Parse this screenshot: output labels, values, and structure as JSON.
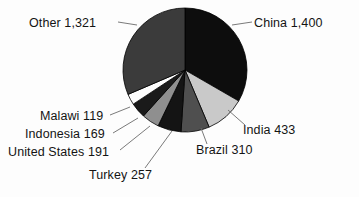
{
  "chart_data": {
    "type": "pie",
    "title": "",
    "total": 4200,
    "unit": "",
    "legend_position": "none",
    "labels_outside": true,
    "categories": [
      "China",
      "India",
      "Brazil",
      "Turkey",
      "United States",
      "Indonesia",
      "Malawi",
      "Other"
    ],
    "values": [
      1400,
      433,
      310,
      257,
      191,
      169,
      119,
      1321
    ],
    "value_labels": [
      "1,400",
      "433",
      "310",
      "257",
      "191",
      "169",
      "119",
      "1,321"
    ],
    "slices": [
      {
        "name": "China",
        "value": 1400,
        "value_label": "1,400",
        "label": "China 1,400",
        "color": "#0d0d0d",
        "start_angle": 0.0,
        "end_angle": 120.0
      },
      {
        "name": "India",
        "value": 433,
        "value_label": "433",
        "label": "India 433",
        "color": "#c9c9c9",
        "start_angle": 120.0,
        "end_angle": 157.1
      },
      {
        "name": "Brazil",
        "value": 310,
        "value_label": "310",
        "label": "Brazil 310",
        "color": "#4f4f4f",
        "start_angle": 157.1,
        "end_angle": 183.7
      },
      {
        "name": "Turkey",
        "value": 257,
        "value_label": "257",
        "label": "Turkey 257",
        "color": "#141414",
        "start_angle": 183.7,
        "end_angle": 205.7
      },
      {
        "name": "United States",
        "value": 191,
        "value_label": "191",
        "label": "United States 191",
        "color": "#8f8f8f",
        "start_angle": 205.7,
        "end_angle": 222.1
      },
      {
        "name": "Indonesia",
        "value": 169,
        "value_label": "169",
        "label": "Indonesia 169",
        "color": "#1a1a1a",
        "start_angle": 222.1,
        "end_angle": 236.6
      },
      {
        "name": "Malawi",
        "value": 119,
        "value_label": "119",
        "label": "Malawi 119",
        "color": "#fdfdfd",
        "start_angle": 236.6,
        "end_angle": 246.8
      },
      {
        "name": "Other",
        "value": 1321,
        "value_label": "1,321",
        "label": "Other 1,321",
        "color": "#3b3b3b",
        "start_angle": 246.8,
        "end_angle": 360.0
      }
    ],
    "geometry": {
      "center_x": 185,
      "center_y": 70,
      "radius": 62
    },
    "style": {
      "background": "#fdfdfd",
      "text_color": "#141414",
      "leader_line_color": "#6b6b6b",
      "slice_outline": "#000000"
    }
  }
}
